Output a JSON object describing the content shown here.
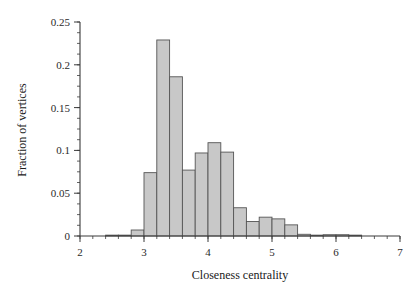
{
  "chart_data": {
    "type": "bar",
    "title": "",
    "subtitle": "",
    "xlabel": "Closeness centrality",
    "ylabel": "Fraction of vertices",
    "xlim": [
      2,
      7
    ],
    "ylim": [
      0,
      0.25
    ],
    "grid": false,
    "legend": null,
    "bin_width": 0.2,
    "xticks": [
      2,
      3,
      4,
      5,
      6,
      7
    ],
    "xtick_labels": [
      "2",
      "3",
      "4",
      "5",
      "6",
      "7"
    ],
    "xminor_step": 0.2,
    "yticks": [
      0,
      0.05,
      0.1,
      0.15,
      0.2,
      0.25
    ],
    "ytick_labels": [
      "0",
      "0.05",
      "0.1",
      "0.15",
      "0.2",
      "0.25"
    ],
    "yminor_step": 0.0125,
    "bar_fill": "#c8c8c8",
    "bar_edge": "#555555",
    "axis_color": "#3a3a3a",
    "bin_left_edges": [
      2.4,
      2.6,
      2.8,
      3.0,
      3.2,
      3.4,
      3.6,
      3.8,
      4.0,
      4.2,
      4.4,
      4.6,
      4.8,
      5.0,
      5.2,
      5.4,
      5.6,
      5.8,
      6.0,
      6.2
    ],
    "values": [
      0.001,
      0.001,
      0.007,
      0.074,
      0.229,
      0.186,
      0.077,
      0.097,
      0.109,
      0.098,
      0.033,
      0.017,
      0.022,
      0.02,
      0.013,
      0.002,
      0.001,
      0.0015,
      0.0015,
      0.001
    ]
  },
  "axes": {
    "xlabel": "Closeness centrality",
    "ylabel": "Fraction of vertices"
  }
}
